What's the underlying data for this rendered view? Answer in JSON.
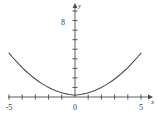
{
  "chart_data": {
    "type": "line",
    "title": "",
    "subtitle": "",
    "xlabel": "x",
    "ylabel": "y",
    "xlim": [
      -5.7,
      5.7
    ],
    "ylim": [
      -0.9,
      9.3
    ],
    "grid": false,
    "legend": null,
    "axis_arrows": true,
    "x_ticks": [
      -5,
      -4,
      -3,
      -2,
      -1,
      0,
      1,
      2,
      3,
      4,
      5
    ],
    "x_tick_labels": [
      "-5",
      "",
      "",
      "",
      "",
      "0",
      "",
      "",
      "",
      "",
      "5"
    ],
    "y_ticks": [
      1,
      2,
      3,
      4,
      5,
      6,
      7,
      8,
      9
    ],
    "y_tick_labels": [
      "",
      "",
      "",
      "",
      "",
      "",
      "",
      "8",
      ""
    ],
    "series": [
      {
        "name": "curve",
        "color": "#4a4a4a",
        "x": [
          -5.0,
          -4.75,
          -4.5,
          -4.25,
          -4.0,
          -3.75,
          -3.5,
          -3.25,
          -3.0,
          -2.75,
          -2.5,
          -2.25,
          -2.0,
          -1.75,
          -1.5,
          -1.25,
          -1.0,
          -0.75,
          -0.5,
          -0.25,
          0.0,
          0.25,
          0.5,
          0.75,
          1.0,
          1.25,
          1.5,
          1.75,
          2.0,
          2.25,
          2.5,
          2.75,
          3.0,
          3.25,
          3.5,
          3.75,
          4.0,
          4.25,
          4.5,
          4.75,
          5.0
        ],
        "y": [
          4.6,
          4.19,
          3.8,
          3.43,
          3.08,
          2.75,
          2.44,
          2.15,
          1.88,
          1.63,
          1.4,
          1.19,
          1.0,
          0.83,
          0.68,
          0.55,
          0.44,
          0.35,
          0.28,
          0.23,
          0.2,
          0.23,
          0.28,
          0.35,
          0.44,
          0.55,
          0.68,
          0.83,
          1.0,
          1.19,
          1.4,
          1.63,
          1.88,
          2.15,
          2.44,
          2.75,
          3.08,
          3.43,
          3.8,
          4.19,
          4.6
        ]
      }
    ]
  },
  "labels": {
    "y_axis": "y",
    "x_axis": "x",
    "y_eight": "8",
    "x_neg_five": "-5",
    "x_five": "5",
    "origin": "0"
  }
}
